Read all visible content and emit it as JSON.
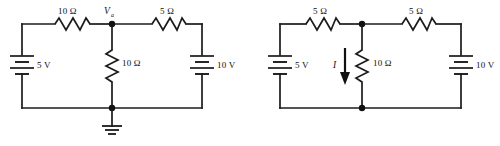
{
  "figure": {
    "background_color": "#ffffff",
    "ink_color": "#1b1b1b"
  },
  "circuits": [
    {
      "id": "left-circuit",
      "name": "node-voltage-circuit",
      "node_label": "V",
      "node_label_sub": "a",
      "has_ground": true,
      "ground_name": "ground-symbol",
      "components": [
        {
          "name": "resistor-top-left",
          "type": "resistor",
          "label": "10 Ω",
          "orientation": "horizontal"
        },
        {
          "name": "resistor-top-right",
          "type": "resistor",
          "label": "5 Ω",
          "orientation": "horizontal"
        },
        {
          "name": "resistor-middle",
          "type": "resistor",
          "label": "10 Ω",
          "orientation": "vertical"
        },
        {
          "name": "battery-left",
          "type": "battery",
          "label": "5 V",
          "orientation": "vertical"
        },
        {
          "name": "battery-right",
          "type": "battery",
          "label": "10 V",
          "orientation": "vertical"
        }
      ]
    },
    {
      "id": "right-circuit",
      "name": "current-through-resistor-circuit",
      "has_ground": false,
      "current_label": "I",
      "current_direction": "down",
      "components": [
        {
          "name": "resistor-top-left",
          "type": "resistor",
          "label": "5 Ω",
          "orientation": "horizontal"
        },
        {
          "name": "resistor-top-right",
          "type": "resistor",
          "label": "5 Ω",
          "orientation": "horizontal"
        },
        {
          "name": "resistor-middle",
          "type": "resistor",
          "label": "10 Ω",
          "orientation": "vertical"
        },
        {
          "name": "battery-left",
          "type": "battery",
          "label": "5 V",
          "orientation": "vertical"
        },
        {
          "name": "battery-right",
          "type": "battery",
          "label": "10 V",
          "orientation": "vertical"
        }
      ]
    }
  ]
}
